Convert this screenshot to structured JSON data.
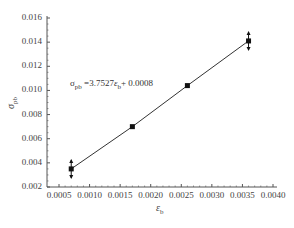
{
  "chart_data": {
    "type": "scatter",
    "title": "",
    "xlabel": "ε_b",
    "ylabel": "σ_pb",
    "xlim": [
      0.0005,
      0.004
    ],
    "ylim": [
      0.002,
      0.016
    ],
    "x_ticks": [
      "0.0005",
      "0.0010",
      "0.0015",
      "0.0020",
      "0.0025",
      "0.0030",
      "0.0035",
      "0.0040"
    ],
    "y_ticks": [
      "0.002",
      "0.004",
      "0.006",
      "0.008",
      "0.010",
      "0.012",
      "0.014",
      "0.016"
    ],
    "grid": false,
    "series": [
      {
        "name": "data",
        "marker": "square",
        "x": [
          0.0007,
          0.0017,
          0.0026,
          0.0036
        ],
        "y": [
          0.0035,
          0.007,
          0.0104,
          0.0141
        ],
        "error_bars_on": [
          0,
          3
        ]
      },
      {
        "name": "fit",
        "type": "line",
        "equation": "σ_pb = 3.7527ε_b + 0.0008",
        "slope": 3.7527,
        "intercept": 0.0008,
        "x": [
          0.0007,
          0.0036
        ]
      }
    ],
    "annotations": [
      "σ_pb =3.7527ε_b + 0.0008"
    ]
  },
  "labels": {
    "y_axis_main": "σ",
    "y_axis_sub": "pb",
    "x_axis_main": "ε",
    "x_axis_sub": "b",
    "eq_sigma": "σ",
    "eq_sigma_sub": "pb",
    "eq_mid": " =3.7527",
    "eq_eps": "ε",
    "eq_eps_sub": "b",
    "eq_tail": "+ 0.0008"
  },
  "colors": {
    "axis": "#555555",
    "line": "#333333",
    "marker": "#111111"
  }
}
